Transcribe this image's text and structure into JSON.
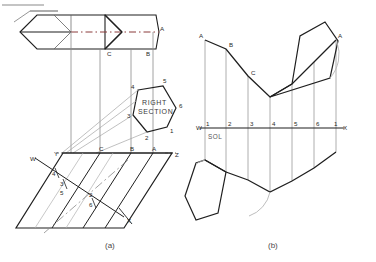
{
  "figure": {
    "captions": [
      {
        "id": "caption-a",
        "text": "(a)",
        "x": 108,
        "y": 247
      },
      {
        "id": "caption-b",
        "text": "(b)",
        "x": 272,
        "y": 247
      }
    ],
    "annotations": {
      "right_section_line1": "RIGHT",
      "right_section_line2": "SECTION",
      "sol": "SOL"
    }
  },
  "part_a": {
    "name": "oblique-hexagonal-prism-views",
    "top_view": {
      "label": "top-view-hexagon",
      "outline": "20,32 37,15 105,15 122,32 105,49 37,49",
      "mid_line": "20,32 122,32",
      "inner_edges": [
        "54,15 71,32",
        "71,32 54,49"
      ],
      "dashed_center": "71,32 159,32",
      "right_lobe": "71,15 105,15 122,32 105,49 71,49",
      "far_right": "105,15 156,15 159,32 156,49 105,49",
      "labels": [
        {
          "text": "A",
          "x": 160,
          "y": 31
        },
        {
          "text": "B",
          "x": 146,
          "y": 55
        },
        {
          "text": "C",
          "x": 107,
          "y": 55
        }
      ]
    },
    "right_section": {
      "label": "right-section-hexagon",
      "outline": "138,90 163,86 176,108 167,127 147,132 133,115",
      "vertex_labels": [
        {
          "text": "4",
          "x": 133,
          "y": 88
        },
        {
          "text": "5",
          "x": 164,
          "y": 83
        },
        {
          "text": "6",
          "x": 179,
          "y": 108
        },
        {
          "text": "1",
          "x": 170,
          "y": 132
        },
        {
          "text": "2",
          "x": 147,
          "y": 138
        },
        {
          "text": "3",
          "x": 128,
          "y": 117
        }
      ],
      "caption_x": 142,
      "caption_y1": 104,
      "caption_y2": 113
    },
    "base_line": {
      "label": "YZ-ground-line",
      "from_x": 62,
      "to_x": 172,
      "y": 153,
      "labels": [
        {
          "text": "Y",
          "x": 55,
          "y": 155
        },
        {
          "text": "Z",
          "x": 174,
          "y": 156
        },
        {
          "text": "C",
          "x": 100,
          "y": 150
        },
        {
          "text": "B",
          "x": 131,
          "y": 150
        },
        {
          "text": "A",
          "x": 153,
          "y": 150
        }
      ]
    },
    "wx_line": {
      "label": "WX-cut-line",
      "from": "35,158",
      "to": "124,217",
      "labels": [
        {
          "text": "W",
          "x": 31,
          "y": 160
        },
        {
          "text": "X",
          "x": 126,
          "y": 221
        },
        {
          "text": "4",
          "x": 55,
          "y": 176
        },
        {
          "text": "3",
          "x": 62,
          "y": 185
        },
        {
          "text": "5",
          "x": 62,
          "y": 194
        },
        {
          "text": "2",
          "x": 91,
          "y": 196
        },
        {
          "text": "6",
          "x": 91,
          "y": 206
        }
      ]
    },
    "parallelogram": {
      "label": "oblique-prism-front-view",
      "outline": "63,153 172,153 124,228 16,228",
      "ribs": [
        "100,153 52,228",
        "131,153 83,228",
        "153,153 105,228"
      ]
    }
  },
  "part_b": {
    "name": "development-of-prism",
    "wx_line": {
      "label": "WX-development-line",
      "from_x": 203,
      "to_x": 340,
      "y": 128,
      "labels": [
        {
          "text": "W",
          "x": 198,
          "y": 130
        },
        {
          "text": "X",
          "x": 342,
          "y": 130
        },
        {
          "text": "1",
          "x": 206,
          "y": 127
        },
        {
          "text": "2",
          "x": 227,
          "y": 127
        },
        {
          "text": "3",
          "x": 249,
          "y": 127
        },
        {
          "text": "4",
          "x": 271,
          "y": 127
        },
        {
          "text": "5",
          "x": 293,
          "y": 127
        },
        {
          "text": "6",
          "x": 315,
          "y": 127
        },
        {
          "text": "1",
          "x": 334,
          "y": 127
        }
      ],
      "sol_label": {
        "text": "SOL",
        "x": 210,
        "y": 138
      }
    },
    "stations_x": [
      205,
      226,
      248,
      270,
      292,
      314,
      336
    ],
    "upper_profile": "205,40 226,49 248,76 270,97 292,84 314,62 336,40",
    "lower_profile": "205,160 226,172 248,180 270,192 292,181 314,168 336,152",
    "upper_labels": [
      {
        "text": "A",
        "x": 200,
        "y": 38
      },
      {
        "text": "B",
        "x": 229,
        "y": 46
      },
      {
        "text": "C",
        "x": 251,
        "y": 74
      },
      {
        "text": "A",
        "x": 338,
        "y": 38
      }
    ],
    "upper_hexagon": "270,97 292,84 300,36 325,22 338,41 330,78",
    "lower_hexagon": "205,160 226,172 218,213 196,220 185,196 196,163",
    "arc_upper": "M 330,78 A 34 34 0 0 0 336,41",
    "arc_lower": "M 270,192 A 30 30 0 0 1 250,215"
  },
  "colors": {
    "ink": "#1f1f1f",
    "ink_light": "#8a8a8a",
    "ink_mid": "#5f5f5f",
    "paper": "#ffffff"
  }
}
